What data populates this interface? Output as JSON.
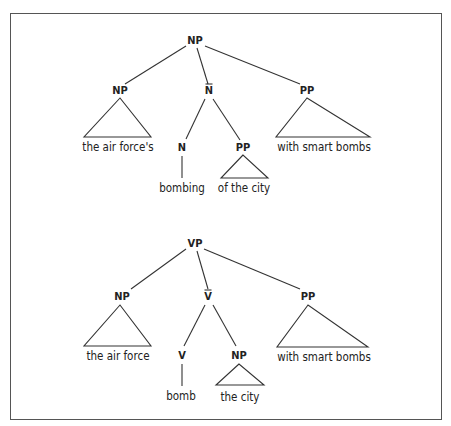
{
  "diagram": {
    "type": "syntax-trees",
    "frame": {
      "x": 10,
      "y": 13,
      "w": 432,
      "h": 407,
      "border_color": "#555555"
    },
    "trees": [
      {
        "id": "np-tree",
        "root": {
          "label": "NP",
          "x": 195,
          "y": 44
        },
        "nodes": [
          {
            "id": "np_subj",
            "label": "NP",
            "x": 120,
            "y": 94,
            "bar": false
          },
          {
            "id": "nbar",
            "label": "N",
            "x": 209,
            "y": 94,
            "bar": true
          },
          {
            "id": "pp_adj",
            "label": "PP",
            "x": 307,
            "y": 94,
            "bar": false
          },
          {
            "id": "n_head",
            "label": "N",
            "x": 182,
            "y": 151,
            "bar": false
          },
          {
            "id": "pp_comp",
            "label": "PP",
            "x": 243,
            "y": 151,
            "bar": false
          }
        ],
        "edges": [
          {
            "x1": 186,
            "y1": 46,
            "x2": 125,
            "y2": 84
          },
          {
            "x1": 197,
            "y1": 48,
            "x2": 208,
            "y2": 84
          },
          {
            "x1": 205,
            "y1": 46,
            "x2": 300,
            "y2": 84
          },
          {
            "x1": 205,
            "y1": 99,
            "x2": 186,
            "y2": 139
          },
          {
            "x1": 213,
            "y1": 99,
            "x2": 240,
            "y2": 140
          },
          {
            "x1": 182,
            "y1": 156,
            "x2": 182,
            "y2": 178
          }
        ],
        "triangles": [
          {
            "apex": [
              120,
              98
            ],
            "left": [
              84,
              137
            ],
            "right": [
              151,
              137
            ]
          },
          {
            "apex": [
              243,
              155
            ],
            "left": [
              221,
              178
            ],
            "right": [
              268,
              178
            ]
          },
          {
            "apex": [
              307,
              98
            ],
            "left": [
              276,
              137
            ],
            "right": [
              370,
              137
            ]
          }
        ],
        "leaves": [
          {
            "text": "the air force's",
            "x": 118,
            "y": 151
          },
          {
            "text": "bombing",
            "x": 182,
            "y": 192
          },
          {
            "text": "of the city",
            "x": 244,
            "y": 192
          },
          {
            "text": "with smart bombs",
            "x": 324,
            "y": 151
          }
        ]
      },
      {
        "id": "vp-tree",
        "root": {
          "label": "VP",
          "x": 195,
          "y": 247
        },
        "nodes": [
          {
            "id": "np_subj",
            "label": "NP",
            "x": 122,
            "y": 300,
            "bar": false
          },
          {
            "id": "vbar",
            "label": "V",
            "x": 208,
            "y": 300,
            "bar": true
          },
          {
            "id": "pp_adj",
            "label": "PP",
            "x": 308,
            "y": 300,
            "bar": false
          },
          {
            "id": "v_head",
            "label": "V",
            "x": 182,
            "y": 359,
            "bar": false
          },
          {
            "id": "np_obj",
            "label": "NP",
            "x": 239,
            "y": 359,
            "bar": false
          }
        ],
        "edges": [
          {
            "x1": 186,
            "y1": 249,
            "x2": 131,
            "y2": 289
          },
          {
            "x1": 197,
            "y1": 251,
            "x2": 208,
            "y2": 289
          },
          {
            "x1": 204,
            "y1": 249,
            "x2": 300,
            "y2": 289
          },
          {
            "x1": 205,
            "y1": 305,
            "x2": 184,
            "y2": 346
          },
          {
            "x1": 213,
            "y1": 305,
            "x2": 236,
            "y2": 346
          },
          {
            "x1": 182,
            "y1": 364,
            "x2": 182,
            "y2": 386
          }
        ],
        "triangles": [
          {
            "apex": [
              120,
              305
            ],
            "left": [
              84,
              346
            ],
            "right": [
              151,
              346
            ]
          },
          {
            "apex": [
              239,
              364
            ],
            "left": [
              216,
              385
            ],
            "right": [
              264,
              385
            ]
          },
          {
            "apex": [
              308,
              305
            ],
            "left": [
              277,
              347
            ],
            "right": [
              368,
              347
            ]
          }
        ],
        "leaves": [
          {
            "text": "the air force",
            "x": 118,
            "y": 360
          },
          {
            "text": "bomb",
            "x": 181,
            "y": 400
          },
          {
            "text": "the city",
            "x": 240,
            "y": 401
          },
          {
            "text": "with smart bombs",
            "x": 324,
            "y": 361
          }
        ]
      }
    ]
  }
}
